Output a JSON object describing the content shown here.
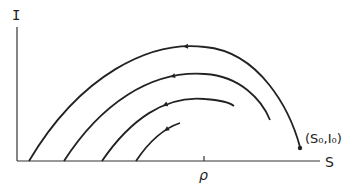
{
  "axes": {
    "y_label": "I",
    "x_label": "S",
    "x_tick_label": "ρ",
    "initial_point_label": "(S₀,I₀)"
  },
  "curves": [
    {
      "name": "trajectory-1",
      "d": "M29,161 C80,75 150,40 205,47 C260,52 290,110 300,147"
    },
    {
      "name": "trajectory-2",
      "d": "M64,161 C100,105 150,70 205,74 C240,76 262,100 270,120"
    },
    {
      "name": "trajectory-3",
      "d": "M102,161 C130,120 165,95 205,99 C220,100 230,103 234,106"
    },
    {
      "name": "trajectory-4",
      "d": "M136,161 C150,140 165,128 180,123"
    }
  ],
  "colors": {
    "stroke": "#222222",
    "background": "#ffffff"
  }
}
